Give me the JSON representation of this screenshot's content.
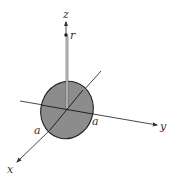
{
  "diagram": {
    "axes": {
      "x_label": "x",
      "y_label": "y",
      "z_label": "z"
    },
    "point_label": "r",
    "radius_labels": [
      "a",
      "a"
    ],
    "colors": {
      "disk_fill": "#8c8c8c",
      "axis": "#333333",
      "background": "#ffffff"
    }
  }
}
